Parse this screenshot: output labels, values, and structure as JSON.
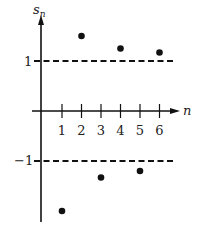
{
  "chart_data": {
    "type": "scatter",
    "title": "",
    "xlabel": "n",
    "ylabel": "s_n",
    "x_ticks": [
      "1",
      "2",
      "3",
      "4",
      "5",
      "6"
    ],
    "y_ticks": [
      "1",
      "-1"
    ],
    "x": [
      1,
      2,
      3,
      4,
      5,
      6
    ],
    "values": [
      -2.0,
      1.5,
      -1.33,
      1.25,
      -1.2,
      1.17
    ],
    "reference_lines": [
      {
        "y": 1,
        "style": "dashed"
      },
      {
        "y": -1,
        "style": "dashed"
      }
    ],
    "grid": false,
    "legend": null
  },
  "labels": {
    "ylabel_main": "s",
    "ylabel_sub": "n",
    "xlabel": "n",
    "ytick_pos": "1",
    "ytick_neg": "−1"
  }
}
